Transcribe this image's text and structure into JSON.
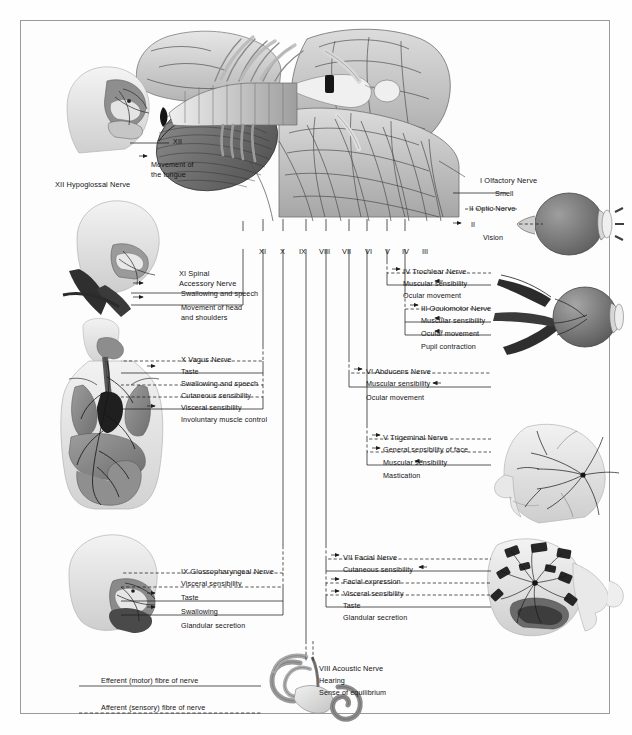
{
  "figure": {
    "roman_numerals_row": [
      "XI",
      "X",
      "IX",
      "VIII",
      "VII",
      "VI",
      "V",
      "IV",
      "III"
    ]
  },
  "legend": {
    "items": [
      {
        "label": "Efferent (motor) fibre of nerve",
        "line": "solid"
      },
      {
        "label": "Afferent (sensory) fibre of nerve",
        "line": "dashed"
      }
    ]
  },
  "nerves": {
    "xii": {
      "numeral": "XII",
      "name": "XII Hypoglossal Nerve",
      "tag": "XII",
      "functions": [
        {
          "label": "Movement of\nthe tongue",
          "line": "solid",
          "arrow": "leading"
        }
      ]
    },
    "xi": {
      "name": "XI Spinal\nAccessory Nerve",
      "name_line1": "XI Spinal",
      "name_line2": "Accessory Nerve",
      "functions": [
        {
          "label": "Swallowing and speech",
          "line": "solid",
          "arrow": "leading"
        },
        {
          "label": "Movement of head",
          "label2": "and shoulders",
          "line": "solid",
          "arrow": "leading"
        }
      ]
    },
    "x": {
      "name": "X Vagus Nerve",
      "functions": [
        {
          "label": "Taste",
          "line": "dashed",
          "arrow": "trailing"
        },
        {
          "label": "Swallowing and speech",
          "line": "solid",
          "arrow": "leading"
        },
        {
          "label": "Cutaneous sensibility",
          "line": "dashed",
          "arrow": "trailing"
        },
        {
          "label": "Visceral sensibility",
          "line": "dashed",
          "arrow": "trailing"
        },
        {
          "label": "Involuntary muscle control",
          "line": "solid",
          "arrow": "leading"
        }
      ]
    },
    "ix": {
      "name": "IX Glossopharyngeal Nerve",
      "functions": [
        {
          "label": "Visceral sensibility",
          "line": "dashed",
          "arrow": "trailing"
        },
        {
          "label": "Taste",
          "line": "dashed",
          "arrow": "trailing"
        },
        {
          "label": "Swallowing",
          "line": "solid",
          "arrow": "leading"
        },
        {
          "label": "Glandular secretion",
          "line": "solid",
          "arrow": "leading"
        }
      ]
    },
    "viii": {
      "name": "VIII Acoustic Nerve",
      "functions": [
        {
          "label": "Hearing",
          "line": "dashed",
          "arrow": "none"
        },
        {
          "label": "Sense of equilibrium",
          "line": "dashed",
          "arrow": "none"
        }
      ]
    },
    "vii": {
      "name": "VII Facial Nerve",
      "functions": [
        {
          "label": "Cutaneous sensibility",
          "line": "dashed",
          "arrow": "leading"
        },
        {
          "label": "Facial expression",
          "line": "solid",
          "arrow": "trailing"
        },
        {
          "label": "Visceral sensibility",
          "line": "dashed",
          "arrow": "leading"
        },
        {
          "label": "Taste",
          "line": "dashed",
          "arrow": "leading"
        },
        {
          "label": "Glandular secretion",
          "line": "solid",
          "arrow": "trailing"
        }
      ]
    },
    "vi": {
      "name": "VI Abducens Nerve",
      "functions": [
        {
          "label": "Muscular sensibility",
          "line": "dashed",
          "arrow": "leading"
        },
        {
          "label": "Ocular movement",
          "line": "solid",
          "arrow": "trailing"
        }
      ]
    },
    "v": {
      "name": "V Trigeminal Nerve",
      "functions": [
        {
          "label": "General sensibility of face",
          "line": "dashed",
          "arrow": "leading"
        },
        {
          "label": "Muscular sensibility",
          "line": "dashed",
          "arrow": "leading"
        },
        {
          "label": "Mastication",
          "line": "solid",
          "arrow": "trailing"
        }
      ]
    },
    "iv": {
      "name": "IV Trochlear Nerve",
      "functions": [
        {
          "label": "Muscular sensibility",
          "line": "dashed",
          "arrow": "leading"
        },
        {
          "label": "Ocular movement",
          "line": "solid",
          "arrow": "trailing"
        }
      ]
    },
    "iii": {
      "name": "III Oculomotor Nerve",
      "functions": [
        {
          "label": "Muscular sensibility",
          "line": "dashed",
          "arrow": "leading"
        },
        {
          "label": "Ocular movement",
          "line": "solid",
          "arrow": "trailing"
        },
        {
          "label": "Pupil contraction",
          "line": "solid",
          "arrow": "trailing"
        }
      ]
    },
    "ii": {
      "name": "II Optic Nerve",
      "tag": "II",
      "functions": [
        {
          "label": "Vision",
          "line": "dashed",
          "arrow": "leading"
        }
      ]
    },
    "i": {
      "name": "I Olfactory Nerve",
      "functions": [
        {
          "label": "Smell",
          "line": "dashed",
          "arrow": "none"
        }
      ]
    }
  },
  "colors": {
    "ink": "#1d1d1d",
    "border": "#9a9a9a",
    "page": "#fdfdfd",
    "tissue_light": "#d9d9d9",
    "tissue_mid": "#a8a8a8",
    "tissue_dark": "#6e6e6e",
    "tissue_darkest": "#3c3c3c"
  }
}
